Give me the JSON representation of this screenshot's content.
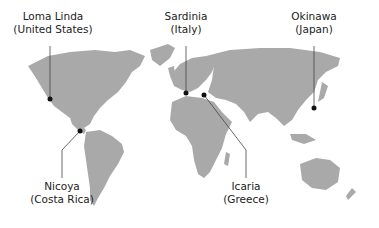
{
  "map": {
    "type": "world-map",
    "land_color": "#a8a8a8",
    "marker_color": "#111111",
    "line_color": "#444444",
    "locations": [
      {
        "name": "Loma Linda",
        "country": "(United States)",
        "marker": [
          50,
          99
        ],
        "label": [
          53,
          24
        ]
      },
      {
        "name": "Sardinia",
        "country": "(Italy)",
        "marker": [
          186,
          93
        ],
        "label": [
          186,
          24
        ]
      },
      {
        "name": "Okinawa",
        "country": "(Japan)",
        "marker": [
          314,
          108
        ],
        "label": [
          314,
          24
        ]
      },
      {
        "name": "Nicoya",
        "country": "(Costa Rica)",
        "marker": [
          80,
          131
        ],
        "label": [
          62,
          190
        ]
      },
      {
        "name": "Icaria",
        "country": "(Greece)",
        "marker": [
          204,
          95
        ],
        "label": [
          246,
          190
        ]
      }
    ]
  }
}
